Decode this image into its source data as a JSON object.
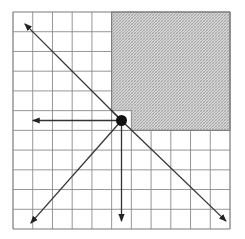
{
  "diagram": {
    "title": "",
    "grid": {
      "columns": 11,
      "rows": 11
    },
    "shaded_region": {
      "col_start": 5,
      "col_end": 11,
      "row_start": 0,
      "row_end": 6,
      "pattern": "fine crosshatch"
    },
    "highlight_cell": {
      "col": 5,
      "row": 5
    },
    "origin_point": {
      "col": 5.5,
      "row": 5.5
    },
    "arrows": [
      {
        "name": "arrow-up-left",
        "from": [
          5.5,
          5.5
        ],
        "to": [
          0.6,
          0.6
        ]
      },
      {
        "name": "arrow-left",
        "from": [
          5.5,
          5.5
        ],
        "to": [
          1.0,
          5.5
        ]
      },
      {
        "name": "arrow-down-left",
        "from": [
          5.5,
          5.5
        ],
        "to": [
          0.9,
          10.7
        ]
      },
      {
        "name": "arrow-down",
        "from": [
          5.5,
          5.5
        ],
        "to": [
          5.5,
          10.6
        ]
      },
      {
        "name": "arrow-down-right",
        "from": [
          5.5,
          5.5
        ],
        "to": [
          10.8,
          10.6
        ]
      }
    ],
    "colors": {
      "grid_line": "#8a8a8a",
      "border": "#7a7a7a",
      "shade": "#bdbdbd",
      "arrow": "#333333",
      "point": "#111111",
      "background": "#ffffff"
    }
  }
}
